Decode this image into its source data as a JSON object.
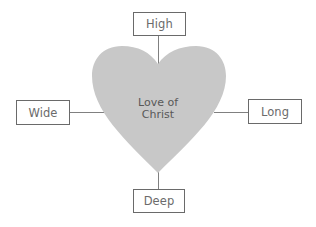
{
  "diagram": {
    "center": {
      "line1": "Love of",
      "line2": "Christ",
      "shape": "heart",
      "fill": "#c8c8c8"
    },
    "nodes": {
      "top": {
        "label": "High"
      },
      "left": {
        "label": "Wide"
      },
      "right": {
        "label": "Long"
      },
      "bottom": {
        "label": "Deep"
      }
    },
    "colors": {
      "box_border": "#6a6a6a",
      "connector": "#808080",
      "text": "#6b6b6b"
    }
  }
}
